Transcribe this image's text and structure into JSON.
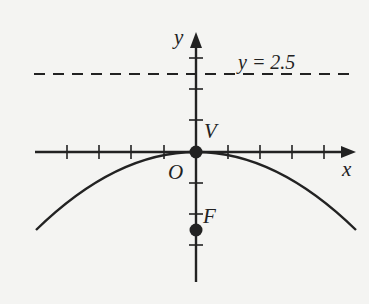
{
  "diagram": {
    "type": "parabola-graph",
    "equation_implied": "x^2 = -10y",
    "labels": {
      "x_axis": "x",
      "y_axis": "y",
      "origin": "O",
      "vertex": "V",
      "focus": "F",
      "directrix": "y = 2.5"
    },
    "points": {
      "vertex": {
        "x": 0,
        "y": 0
      },
      "focus": {
        "x": 0,
        "y": -2.5
      }
    },
    "directrix_y": 2.5,
    "x_ticks": [
      -4,
      -3,
      -2,
      -1,
      1,
      2,
      3,
      4
    ],
    "y_ticks": [
      -3,
      -2,
      -1,
      1,
      2,
      3
    ],
    "colors": {
      "ink": "#222222",
      "background": "#f4f4f2"
    }
  }
}
